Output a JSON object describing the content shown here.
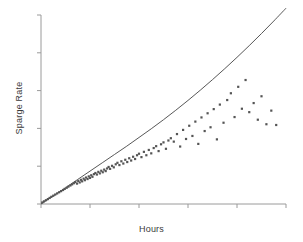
{
  "chart_data": {
    "type": "scatter",
    "title": "",
    "xlabel": "Hours",
    "ylabel": "Sparge Rate",
    "grid": false,
    "legend": null,
    "xlim": [
      0,
      10
    ],
    "ylim": [
      0,
      10
    ],
    "x_ticks": [
      0,
      2,
      4,
      6,
      8,
      10
    ],
    "y_ticks": [
      0,
      2,
      4,
      6,
      8,
      10
    ],
    "x_tick_labels": [
      "",
      "",
      "",
      "",
      "",
      ""
    ],
    "y_tick_labels": [
      "",
      "",
      "",
      "",
      "",
      ""
    ],
    "marker": "square",
    "marker_color": "#555555",
    "marker_size": 2.2,
    "axis_color": "#9a9a9a",
    "curve_color": "#444444",
    "series": [
      {
        "name": "Observations",
        "type": "scatter",
        "x": [
          0.05,
          0.12,
          0.2,
          0.28,
          0.35,
          0.42,
          0.5,
          0.58,
          0.66,
          0.74,
          0.82,
          0.9,
          0.97,
          1.05,
          1.12,
          1.2,
          1.27,
          1.34,
          1.4,
          1.47,
          1.52,
          1.58,
          1.63,
          1.68,
          1.74,
          1.79,
          1.84,
          1.9,
          1.95,
          2.0,
          2.05,
          2.1,
          2.16,
          2.22,
          2.28,
          2.34,
          2.4,
          2.46,
          2.52,
          2.58,
          2.64,
          2.7,
          2.76,
          2.82,
          2.9,
          2.97,
          3.05,
          3.12,
          3.2,
          3.28,
          3.36,
          3.44,
          3.52,
          3.6,
          3.68,
          3.76,
          3.84,
          3.92,
          4.0,
          4.1,
          4.2,
          4.3,
          4.4,
          4.5,
          4.6,
          4.7,
          4.8,
          4.9,
          5.0,
          5.1,
          5.2,
          5.3,
          5.42,
          5.55,
          5.68,
          5.8,
          5.92,
          6.05,
          6.18,
          6.3,
          6.42,
          6.55,
          6.68,
          6.8,
          6.92,
          7.05,
          7.18,
          7.3,
          7.45,
          7.6,
          7.75,
          7.9,
          8.05,
          8.2,
          8.35,
          8.5,
          8.68,
          8.85,
          9.0,
          9.2,
          9.4,
          9.6
        ],
        "y": [
          0.08,
          0.14,
          0.2,
          0.26,
          0.32,
          0.38,
          0.44,
          0.5,
          0.56,
          0.62,
          0.68,
          0.74,
          0.8,
          0.86,
          0.92,
          0.98,
          1.04,
          1.1,
          1.16,
          1.08,
          1.22,
          1.14,
          1.28,
          1.2,
          1.34,
          1.26,
          1.4,
          1.32,
          1.46,
          1.38,
          1.52,
          1.44,
          1.58,
          1.64,
          1.56,
          1.7,
          1.62,
          1.76,
          1.68,
          1.82,
          1.74,
          1.88,
          1.96,
          1.86,
          2.02,
          1.94,
          2.1,
          2.18,
          2.06,
          2.26,
          2.14,
          2.34,
          2.22,
          2.42,
          2.3,
          2.5,
          2.38,
          2.58,
          2.66,
          2.48,
          2.76,
          2.58,
          2.86,
          2.68,
          2.96,
          3.06,
          2.8,
          3.16,
          3.26,
          2.92,
          3.36,
          3.48,
          3.3,
          3.7,
          3.04,
          3.92,
          3.44,
          4.14,
          3.6,
          4.36,
          3.18,
          4.58,
          3.86,
          4.8,
          4.06,
          5.02,
          3.42,
          5.26,
          4.3,
          5.5,
          5.86,
          4.6,
          6.2,
          5.04,
          6.56,
          4.86,
          5.34,
          4.46,
          5.7,
          4.22,
          4.94,
          4.18
        ]
      },
      {
        "name": "Fitted curve",
        "type": "line",
        "fit": "exponential-growth",
        "x": [
          0.0,
          0.5,
          1.0,
          1.5,
          2.0,
          2.5,
          3.0,
          3.5,
          4.0,
          4.5,
          5.0,
          5.5,
          6.0,
          6.5,
          7.0,
          7.5,
          8.0,
          8.5,
          9.0,
          9.5,
          10.0
        ],
        "y": [
          0.0,
          0.42,
          0.86,
          1.3,
          1.74,
          2.18,
          2.62,
          3.06,
          3.52,
          3.98,
          4.46,
          4.96,
          5.48,
          6.02,
          6.58,
          7.16,
          7.76,
          8.38,
          9.02,
          9.68,
          10.36
        ]
      }
    ],
    "annotations": []
  }
}
